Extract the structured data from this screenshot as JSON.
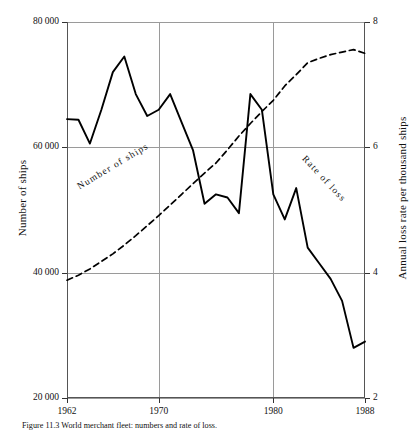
{
  "figure": {
    "caption": "Figure 11.3  World merchant fleet: numbers and rate of loss."
  },
  "chart_data": {
    "type": "line",
    "title": "",
    "xlabel": "",
    "xlim": [
      1962,
      1988
    ],
    "xticks": [
      1962,
      1970,
      1980,
      1988
    ],
    "xticklabels": [
      "1962",
      "1970",
      "1980",
      "1988"
    ],
    "grid": true,
    "grid_color": "#9a9a9a",
    "legend": "inline-labels",
    "axes": [
      {
        "side": "left",
        "label": "Number of ships",
        "ylim": [
          20000,
          80000
        ],
        "yticks": [
          20000,
          40000,
          60000,
          80000
        ],
        "yticklabels": [
          "20 000",
          "40 000",
          "60 000",
          "80 000"
        ]
      },
      {
        "side": "right",
        "label": "Annual loss rate per thousand ships",
        "ylim": [
          2,
          8
        ],
        "yticks": [
          2,
          4,
          6,
          8
        ],
        "yticklabels": [
          "2",
          "4",
          "6",
          "8"
        ]
      }
    ],
    "series": [
      {
        "name": "Number of ships",
        "axis": "left",
        "style": "dashed",
        "color": "#000000",
        "inline_label": "Number of ships",
        "x": [
          1962,
          1963,
          1964,
          1965,
          1966,
          1967,
          1968,
          1969,
          1970,
          1971,
          1972,
          1973,
          1974,
          1975,
          1976,
          1977,
          1978,
          1979,
          1980,
          1981,
          1982,
          1983,
          1984,
          1985,
          1986,
          1987,
          1988
        ],
        "values": [
          38800,
          39600,
          40600,
          41800,
          43000,
          44400,
          45900,
          47500,
          49100,
          50800,
          52500,
          54200,
          55900,
          57500,
          59600,
          61800,
          63800,
          65700,
          67500,
          69800,
          71600,
          73500,
          74200,
          74800,
          75200,
          75600,
          75000
        ]
      },
      {
        "name": "Rate of loss",
        "axis": "right",
        "style": "solid",
        "color": "#000000",
        "inline_label": "Rate of loss",
        "x": [
          1962,
          1963,
          1964,
          1965,
          1966,
          1967,
          1968,
          1969,
          1970,
          1971,
          1972,
          1973,
          1974,
          1975,
          1976,
          1977,
          1978,
          1979,
          1980,
          1981,
          1982,
          1983,
          1984,
          1985,
          1986,
          1987,
          1988
        ],
        "values": [
          6.45,
          6.44,
          6.06,
          6.6,
          7.2,
          7.45,
          6.85,
          6.5,
          6.6,
          6.85,
          6.4,
          5.95,
          5.1,
          5.25,
          5.2,
          4.95,
          6.85,
          6.6,
          5.25,
          4.85,
          5.35,
          4.4,
          4.15,
          3.9,
          3.55,
          2.8,
          2.9
        ]
      }
    ]
  },
  "plot_geometry": {
    "left": 67,
    "right": 365,
    "top": 22,
    "bottom": 398
  }
}
